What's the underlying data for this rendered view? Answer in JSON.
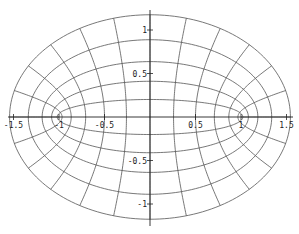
{
  "chart_data": {
    "type": "line",
    "title": "",
    "xlabel": "",
    "ylabel": "",
    "xlim": [
      -1.6,
      1.6
    ],
    "ylim": [
      -1.3,
      1.3
    ],
    "grid": false,
    "legend": null,
    "foci": [
      -1,
      1
    ],
    "mu_values": [
      0.2,
      0.4,
      0.6,
      0.8,
      1.0
    ],
    "nu_step_deg": 15,
    "x_ticks": [
      {
        "value": -1.5,
        "label": "-1.5"
      },
      {
        "value": -1,
        "label": "-1"
      },
      {
        "value": -0.5,
        "label": "-0.5"
      },
      {
        "value": 0.5,
        "label": "0.5"
      },
      {
        "value": 1,
        "label": "1"
      },
      {
        "value": 1.5,
        "label": "1.5"
      }
    ],
    "y_ticks": [
      {
        "value": 1,
        "label": "1"
      },
      {
        "value": 0.5,
        "label": "0.5"
      },
      {
        "value": -0.5,
        "label": "-0.5"
      },
      {
        "value": -1,
        "label": "-1"
      }
    ],
    "line_color": "#555555",
    "axis_color": "#222222"
  }
}
